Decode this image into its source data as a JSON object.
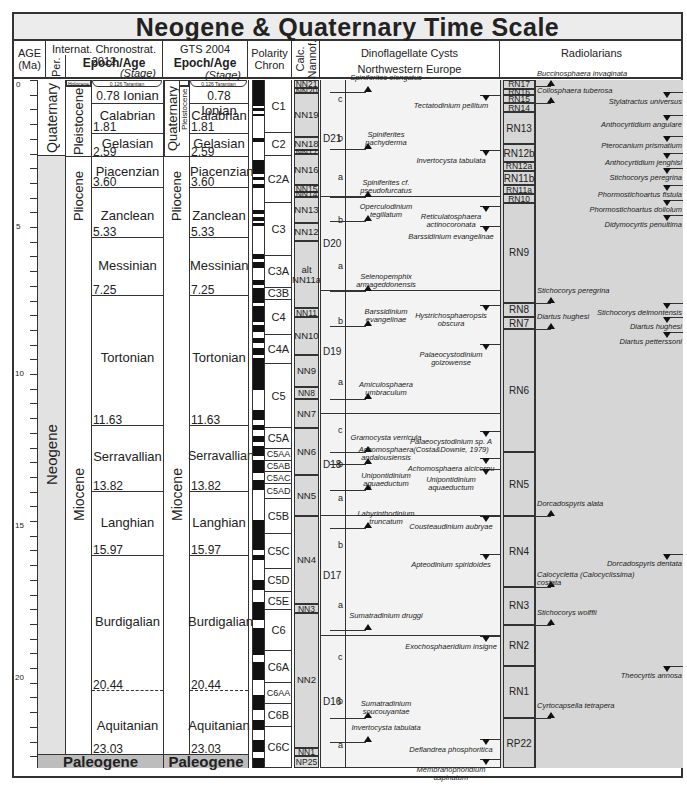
{
  "chart_data": {
    "type": "table",
    "title": "Neogene & Quaternary Time Scale",
    "y_axis": {
      "label": "AGE (Ma)",
      "range": [
        0,
        23.5
      ],
      "major_ticks": [
        0,
        5,
        10,
        15,
        20
      ],
      "minor_step": 1
    },
    "columns": [
      "AGE (Ma)",
      "Internat. Chronostrat. 2012",
      "GTS 2004",
      "Polarity Chron",
      "Calc. Nannof.",
      "Dinoflagellate Cysts Northwestern Europe",
      "Radiolarians"
    ],
    "periods": [
      {
        "name": "Quaternary",
        "top": 0,
        "base": 2.59
      },
      {
        "name": "Neogene",
        "top": 2.59,
        "base": 23.03
      },
      {
        "name": "Paleogene",
        "top": 23.03,
        "base": 23.5
      }
    ],
    "epochs": [
      {
        "name": "Holocene",
        "top": 0,
        "base": 0.0117
      },
      {
        "name": "Pleistocene",
        "top": 0,
        "base": 2.59
      },
      {
        "name": "Pliocene",
        "top": 2.59,
        "base": 5.33
      },
      {
        "name": "Miocene",
        "top": 5.33,
        "base": 23.03
      }
    ],
    "stages_2012": [
      {
        "name": "Tarantian",
        "base": 0.126
      },
      {
        "name": "Ionian",
        "base": 0.78
      },
      {
        "name": "Calabrian",
        "base": 1.81
      },
      {
        "name": "Gelasian",
        "base": 2.59
      },
      {
        "name": "Piacenzian",
        "base": 3.6
      },
      {
        "name": "Zanclean",
        "base": 5.33
      },
      {
        "name": "Messinian",
        "base": 7.25
      },
      {
        "name": "Tortonian",
        "base": 11.63
      },
      {
        "name": "Serravallian",
        "base": 13.82
      },
      {
        "name": "Langhian",
        "base": 15.97
      },
      {
        "name": "Burdigalian",
        "base": 20.44
      },
      {
        "name": "Aquitanian",
        "base": 23.03
      }
    ],
    "polarity_chrons": [
      {
        "name": "C1",
        "top": 0,
        "base": 1.81
      },
      {
        "name": "C2",
        "top": 1.81,
        "base": 2.59
      },
      {
        "name": "C2A",
        "top": 2.59,
        "base": 4.2
      },
      {
        "name": "C3",
        "top": 4.2,
        "base": 6.0
      },
      {
        "name": "C3A",
        "top": 6.0,
        "base": 7.1
      },
      {
        "name": "C3B",
        "top": 7.1,
        "base": 7.5
      },
      {
        "name": "C4",
        "top": 7.5,
        "base": 8.7
      },
      {
        "name": "C4A",
        "top": 8.7,
        "base": 9.7
      },
      {
        "name": "C5",
        "top": 9.7,
        "base": 11.9
      },
      {
        "name": "C5A",
        "top": 11.9,
        "base": 12.6
      },
      {
        "name": "C5AA",
        "top": 12.6,
        "base": 13.0
      },
      {
        "name": "C5AB",
        "top": 13.0,
        "base": 13.4
      },
      {
        "name": "C5AC",
        "top": 13.4,
        "base": 13.8
      },
      {
        "name": "C5AD",
        "top": 13.8,
        "base": 14.3
      },
      {
        "name": "C5B",
        "top": 14.3,
        "base": 15.5
      },
      {
        "name": "C5C",
        "top": 15.5,
        "base": 16.7
      },
      {
        "name": "C5D",
        "top": 16.7,
        "base": 17.5
      },
      {
        "name": "C5E",
        "top": 17.5,
        "base": 18.1
      },
      {
        "name": "C6",
        "top": 18.1,
        "base": 19.5
      },
      {
        "name": "C6A",
        "top": 19.5,
        "base": 20.6
      },
      {
        "name": "C6AA",
        "top": 20.6,
        "base": 21.3
      },
      {
        "name": "C6B",
        "top": 21.3,
        "base": 22.1
      },
      {
        "name": "C6C",
        "top": 22.1,
        "base": 23.5
      }
    ],
    "nannofossil_zones": [
      {
        "name": "NN21",
        "top": 0,
        "base": 0.29
      },
      {
        "name": "NN20",
        "top": 0.29,
        "base": 0.44
      },
      {
        "name": "NN19",
        "top": 0.44,
        "base": 1.95
      },
      {
        "name": "NN18",
        "top": 1.95,
        "base": 2.39
      },
      {
        "name": "NN17",
        "top": 2.39,
        "base": 2.52
      },
      {
        "name": "NN16",
        "top": 2.52,
        "base": 3.6
      },
      {
        "name": "NN15",
        "top": 3.6,
        "base": 3.82
      },
      {
        "name": "NN14",
        "top": 3.82,
        "base": 4.0
      },
      {
        "name": "NN13",
        "top": 4.0,
        "base": 4.9
      },
      {
        "name": "NN12",
        "top": 4.9,
        "base": 5.5
      },
      {
        "name": "alt NN11a",
        "top": 5.5,
        "base": 7.8
      },
      {
        "name": "NN11",
        "top": 7.8,
        "base": 8.1
      },
      {
        "name": "NN10",
        "top": 8.1,
        "base": 9.4
      },
      {
        "name": "NN9",
        "top": 9.4,
        "base": 10.5
      },
      {
        "name": "NN8",
        "top": 10.5,
        "base": 10.9
      },
      {
        "name": "NN7",
        "top": 10.9,
        "base": 11.9
      },
      {
        "name": "NN6",
        "top": 11.9,
        "base": 13.5
      },
      {
        "name": "NN5",
        "top": 13.5,
        "base": 14.9
      },
      {
        "name": "NN4",
        "top": 14.9,
        "base": 17.9
      },
      {
        "name": "NN3",
        "top": 17.9,
        "base": 18.2
      },
      {
        "name": "NN2",
        "top": 18.2,
        "base": 22.8
      },
      {
        "name": "NN1",
        "top": 22.8,
        "base": 23.1
      },
      {
        "name": "NP25",
        "top": 23.1,
        "base": 23.5
      }
    ],
    "dinocyst_zones": [
      {
        "name": "D21",
        "subzones": [
          "c",
          "b",
          "a"
        ],
        "top": 0,
        "base": 4.0
      },
      {
        "name": "D20",
        "subzones": [
          "b",
          "a"
        ],
        "top": 4.0,
        "base": 7.2
      },
      {
        "name": "D19",
        "subzones": [
          "b",
          "a"
        ],
        "top": 7.2,
        "base": 11.4
      },
      {
        "name": "D18",
        "subzones": [
          "c",
          "b",
          "a"
        ],
        "top": 11.4,
        "base": 14.9
      },
      {
        "name": "D17",
        "subzones": [
          "b",
          "a"
        ],
        "top": 14.9,
        "base": 19.0
      },
      {
        "name": "D16",
        "subzones": [
          "c",
          "b",
          "a"
        ],
        "top": 19.0,
        "base": 23.5
      }
    ],
    "dinocyst_events_left": [
      {
        "name": "Spiniferites elongatus",
        "age": 0.4
      },
      {
        "name": "Spiniferites pachyderma",
        "age": 2.35
      },
      {
        "name": "Spiniferites cf. pseudofurcatus",
        "age": 4.0
      },
      {
        "name": "Operculodinium tegillatum",
        "age": 4.8
      },
      {
        "name": "Selenopemphix armageddonensis",
        "age": 7.2
      },
      {
        "name": "Barssidinium evangelinae",
        "age": 8.4
      },
      {
        "name": "Amiculosphaera umbraculum",
        "age": 10.9
      },
      {
        "name": "Gramocysta verricula",
        "age": 12.7
      },
      {
        "name": "Achomosphaera andalousiensis",
        "age": 13.1
      },
      {
        "name": "Unipontidinium aquaeductum",
        "age": 14.0
      },
      {
        "name": "Labyrinthodinium truncatum",
        "age": 15.3
      },
      {
        "name": "Sumatradinium druggi",
        "age": 18.8
      },
      {
        "name": "Sumatradinium soucouyantae",
        "age": 21.8
      },
      {
        "name": "Invertocysta tabulata",
        "age": 22.6
      }
    ],
    "dinocyst_events_right": [
      {
        "name": "Tectatodinium pellitum",
        "age": 0.5
      },
      {
        "name": "Invertocysta tabulata",
        "age": 2.4
      },
      {
        "name": "Reticulatosphaera actinocoronata",
        "age": 4.3
      },
      {
        "name": "Barssidinium evangelinae",
        "age": 5.0
      },
      {
        "name": "Hystrichosphaeropsis obscura",
        "age": 7.7
      },
      {
        "name": "Palaeocystodinium golzowense",
        "age": 9.0
      },
      {
        "name": "Palaeocystodinium sp. A (Costa&Downie, 1979)",
        "age": 12.0
      },
      {
        "name": "Achomosphaera alcicornu",
        "age": 12.9
      },
      {
        "name": "Unipontidinium aquaeductum",
        "age": 13.3
      },
      {
        "name": "Cousteaudinium aubryae",
        "age": 14.9
      },
      {
        "name": "Apteodinium spiridoides",
        "age": 16.2
      },
      {
        "name": "Exochosphaeridium insigne",
        "age": 19.0
      },
      {
        "name": "Deflandrea phosphoritica",
        "age": 22.5
      },
      {
        "name": "Membranophoridium aspinatum",
        "age": 23.2
      }
    ],
    "radiolarian_zones": [
      {
        "name": "RN17",
        "top": 0,
        "base": 0.3
      },
      {
        "name": "RN16",
        "top": 0.3,
        "base": 0.5
      },
      {
        "name": "RN15",
        "top": 0.5,
        "base": 0.8
      },
      {
        "name": "RN14",
        "top": 0.8,
        "base": 1.1
      },
      {
        "name": "RN13",
        "top": 1.1,
        "base": 2.2
      },
      {
        "name": "RN12b",
        "top": 2.2,
        "base": 2.8
      },
      {
        "name": "RN12a",
        "top": 2.8,
        "base": 3.1
      },
      {
        "name": "RN11b",
        "top": 3.1,
        "base": 3.6
      },
      {
        "name": "RN11a",
        "top": 3.6,
        "base": 3.9
      },
      {
        "name": "RN10",
        "top": 3.9,
        "base": 4.2
      },
      {
        "name": "RN9",
        "top": 4.2,
        "base": 7.6
      },
      {
        "name": "RN8",
        "top": 7.6,
        "base": 8.1
      },
      {
        "name": "RN7",
        "top": 8.1,
        "base": 8.5
      },
      {
        "name": "RN6",
        "top": 8.5,
        "base": 12.7
      },
      {
        "name": "RN5",
        "top": 12.7,
        "base": 14.9
      },
      {
        "name": "RN4",
        "top": 14.9,
        "base": 17.3
      },
      {
        "name": "RN3",
        "top": 17.3,
        "base": 18.6
      },
      {
        "name": "RN2",
        "top": 18.6,
        "base": 20.0
      },
      {
        "name": "RN1",
        "top": 20.0,
        "base": 21.8
      },
      {
        "name": "RP22",
        "top": 21.8,
        "base": 23.5
      }
    ],
    "radiolarian_events_left": [
      {
        "name": "Buccinosphaera invaginata",
        "age": 0.2
      },
      {
        "name": "Collosphaera tuberosa",
        "age": 0.8
      },
      {
        "name": "Stichocorys peregrina",
        "age": 7.6
      },
      {
        "name": "Diartus hughesi",
        "age": 8.5
      },
      {
        "name": "Dorcadospyris alata",
        "age": 14.9
      },
      {
        "name": "Calocycletta (Calocyclissima) costata",
        "age": 17.3
      },
      {
        "name": "Stichocorys wolffii",
        "age": 18.6
      },
      {
        "name": "Cyrtocapsella tetrapera",
        "age": 21.8
      }
    ],
    "radiolarian_events_right": [
      {
        "name": "Stylatractus universus",
        "age": 0.4
      },
      {
        "name": "Anthocyrtidium angulare",
        "age": 1.2
      },
      {
        "name": "Pterocanium prismatium",
        "age": 1.9
      },
      {
        "name": "Anthocyrtidium jenghisi",
        "age": 2.5
      },
      {
        "name": "Stichocorys peregrina",
        "age": 3.0
      },
      {
        "name": "Phormostichoartus fistula",
        "age": 3.6
      },
      {
        "name": "Phormostichoartus doliolum",
        "age": 4.1
      },
      {
        "name": "Didymocyrtis penultima",
        "age": 4.6
      },
      {
        "name": "Stichocorys delmontensis",
        "age": 7.6
      },
      {
        "name": "Diartus hughesi",
        "age": 8.1
      },
      {
        "name": "Diartus petterssoni",
        "age": 8.6
      },
      {
        "name": "Dorcadospyris dentata",
        "age": 16.2
      },
      {
        "name": "Theocyrtis annosa",
        "age": 20.0
      }
    ]
  },
  "title": "Neogene & Quaternary Time Scale",
  "headers": {
    "age": "AGE (Ma)",
    "age1": "AGE",
    "age2": "(Ma)",
    "icc": "Internat. Chronostrat. 2012",
    "per": "Per.",
    "epoch_age": "Epoch/Age",
    "stage": "(Stage)",
    "gts": "GTS 2004",
    "polarity1": "Polarity",
    "polarity2": "Chron",
    "nannof": "Calc. Nannof.",
    "dino1": "Dinoflagellate Cysts",
    "dino2": "Northwestern Europe",
    "radio": "Radiolarians"
  },
  "age_ticks": [
    "0",
    "5",
    "10",
    "15",
    "20"
  ],
  "periods": {
    "quaternary": "Quaternary",
    "neogene": "Neogene",
    "paleogene": "Paleogene"
  },
  "epochs": {
    "holocene": "Holocene",
    "pleistocene": "Pleistocene",
    "pliocene": "Pliocene",
    "miocene": "Miocene"
  },
  "stages": {
    "tarantian": "0.126   Tarantian",
    "ionian": "Ionian",
    "calabrian": "Calabrian",
    "gelasian": "Gelasian",
    "piacenzian": "Piacenzian",
    "zanclean": "Zanclean",
    "messinian": "Messinian",
    "tortonian": "Tortonian",
    "serravallian": "Serravallian",
    "langhian": "Langhian",
    "burdigalian": "Burdigalian",
    "aquitanian": "Aquitanian"
  },
  "ages": {
    "a078": "0.78",
    "a181": "1.81",
    "a259": "2.59",
    "a360": "3.60",
    "a533": "5.33",
    "a725": "7.25",
    "a1163": "11.63",
    "a1382": "13.82",
    "a1597": "15.97",
    "a2044": "20.44",
    "a2303": "23.03"
  }
}
